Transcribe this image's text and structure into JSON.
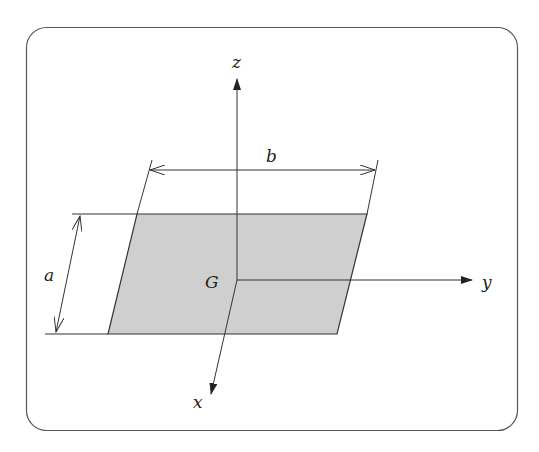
{
  "diagram": {
    "colors": {
      "stroke": "#333333",
      "fill": "#cfcfcf",
      "frame": "#555555",
      "background": "#ffffff"
    },
    "labels": {
      "z_axis": "z",
      "y_axis": "y",
      "x_axis": "x",
      "centroid": "G",
      "dim_a": "a",
      "dim_b": "b"
    }
  }
}
